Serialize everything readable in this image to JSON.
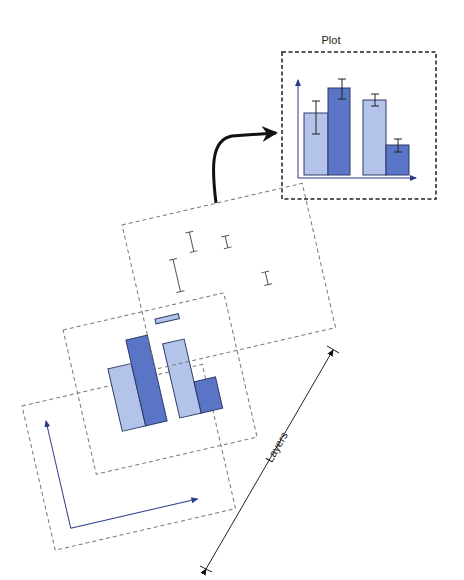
{
  "diagram": {
    "plot_label": "Plot",
    "layers_label": "Layers",
    "colors": {
      "light_bar": "#b3c3ea",
      "dark_bar": "#5a74c6",
      "bar_stroke": "#2d3a6a",
      "axis": "#2a3a8c",
      "dashed": "#777777",
      "plot_dashed": "#222222",
      "arrow": "#111111"
    },
    "plot": {
      "bars": [
        {
          "group": 1,
          "series": "light",
          "height_rel": 0.58,
          "err_rel": 0.18
        },
        {
          "group": 1,
          "series": "dark",
          "height_rel": 0.78,
          "err_rel": 0.08
        },
        {
          "group": 2,
          "series": "light",
          "height_rel": 0.68,
          "err_rel": 0.06
        },
        {
          "group": 2,
          "series": "dark",
          "height_rel": 0.26,
          "err_rel": 0.06
        }
      ]
    },
    "layers": [
      {
        "name": "error-bars-layer"
      },
      {
        "name": "bars-layer"
      },
      {
        "name": "axes-layer"
      }
    ]
  }
}
